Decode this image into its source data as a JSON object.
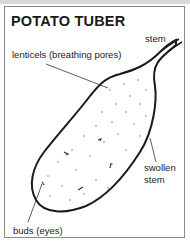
{
  "title": "POTATO TUBER",
  "labels": {
    "stem": "stem",
    "lenticels": "lenticels (breathing pores)",
    "swollen_stem_line1": "swollen",
    "swollen_stem_line2": "stem",
    "buds": "buds (eyes)"
  },
  "colors": {
    "outline": "#1a1a1a",
    "frame": "#8a8a8a",
    "top_strip": "#d9d9d9"
  }
}
